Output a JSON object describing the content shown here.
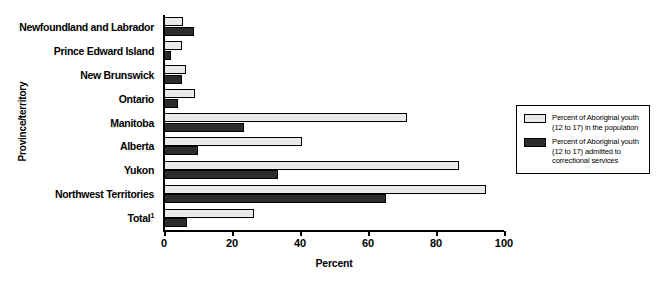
{
  "chart_data": {
    "type": "bar",
    "orientation": "horizontal",
    "title": "",
    "xlabel": "Percent",
    "ylabel": "Province/territory",
    "xlim": [
      0,
      100
    ],
    "xticks": [
      0,
      20,
      40,
      60,
      80,
      100
    ],
    "grid": false,
    "legend_position": "right",
    "categories": [
      "Newfoundland and Labrador",
      "Prince Edward Island",
      "New Brunswick",
      "Ontario",
      "Manitoba",
      "Alberta",
      "Yukon",
      "Northwest Territories",
      "Total"
    ],
    "category_label_html": [
      "Newfoundland and Labrador",
      "Prince Edward Island",
      "New Brunswick",
      "Ontario",
      "Manitoba",
      "Alberta",
      "Yukon",
      "Northwest Territories",
      "Total<sup>1</sup>"
    ],
    "series": [
      {
        "name": "Percent of Aboriginal youth (12 to 17) in the population",
        "color": "#e9e9e9",
        "values": [
          5.6,
          5.2,
          6.4,
          9.1,
          71.5,
          40.6,
          86.8,
          94.7,
          26.5
        ]
      },
      {
        "name": "Percent of Aboriginal youth (12 to 17) admitted to correctional services",
        "color": "#2c2c2c",
        "values": [
          8.8,
          2.2,
          5.2,
          4.0,
          23.5,
          10.0,
          33.5,
          65.3,
          6.8
        ]
      }
    ]
  },
  "axes": {
    "y_title": "Province/territory",
    "x_title": "Percent",
    "x_tick_labels": [
      "0",
      "20",
      "40",
      "60",
      "80",
      "100"
    ]
  },
  "legend": {
    "items": [
      {
        "swatch": "light",
        "line1": "Percent of Aboriginal youth",
        "line2": "(12 to 17) in the population",
        "line3": ""
      },
      {
        "swatch": "dark",
        "line1": "Percent of Aboriginal youth",
        "line2": "(12 to 17) admitted to",
        "line3": "correctional services"
      }
    ]
  },
  "colors": {
    "series_light": "#e9e9e9",
    "series_dark": "#2c2c2c",
    "axis": "#000000",
    "background": "#ffffff"
  }
}
